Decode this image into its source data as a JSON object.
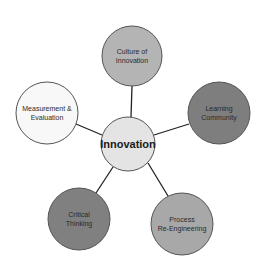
{
  "diagram": {
    "center": {
      "label": "Innovation",
      "cx": 128,
      "cy": 144,
      "r": 27,
      "fill": "#e4e4e4"
    },
    "nodes": [
      {
        "id": "culture",
        "label": "Culture of\nInnovation",
        "cx": 132,
        "cy": 56,
        "r": 30,
        "fill": "#b4b4b4"
      },
      {
        "id": "learning",
        "label": "Learning\nCommunity",
        "cx": 219,
        "cy": 113,
        "r": 31,
        "fill": "#7e7e7e"
      },
      {
        "id": "process",
        "label": "Process\nRe-Engineering",
        "cx": 182,
        "cy": 224,
        "r": 31,
        "fill": "#a8a8a8"
      },
      {
        "id": "critical",
        "label": "Critical\nThinking",
        "cx": 79,
        "cy": 219,
        "r": 31,
        "fill": "#808080"
      },
      {
        "id": "measurement",
        "label": "Measurement &\nEvaluation",
        "cx": 47,
        "cy": 113,
        "r": 31,
        "fill": "#f8f8f8"
      }
    ],
    "connector_color": "#222222",
    "stroke_color": "#555555"
  }
}
